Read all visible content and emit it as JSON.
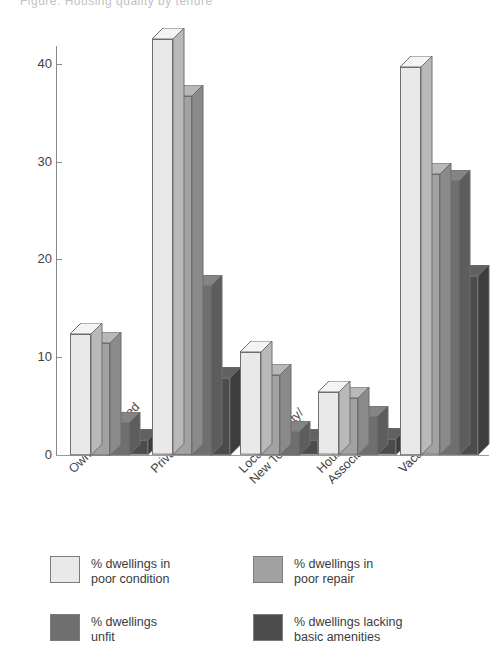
{
  "page": {
    "clipped_heading": "Figure: Housing quality by tenure"
  },
  "chart_data": {
    "type": "bar",
    "title": "",
    "xlabel": "",
    "ylabel": "",
    "ylim": [
      0,
      44
    ],
    "yticks": [
      0,
      10,
      20,
      30,
      40
    ],
    "ytick_labels": [
      "0",
      "10",
      "20",
      "30",
      "40"
    ],
    "grid": false,
    "legend_position": "bottom-left",
    "style": "3d-grouped-columns",
    "categories": [
      "Owner-Occupied",
      "Private-Rented",
      "Local Authority/\nNew Town",
      "Housing\nAssociation",
      "Vacant"
    ],
    "series": [
      {
        "name": "% dwellings in\npoor condition",
        "color": "#e9e9e9",
        "top_color": "#f4f4f4",
        "side_color": "#b9b9b9",
        "values": [
          12.4,
          42.5,
          10.5,
          6.4,
          39.7
        ]
      },
      {
        "name": "% dwellings in\npoor repair",
        "color": "#a2a2a2",
        "top_color": "#b8b8b8",
        "side_color": "#8a8a8a",
        "values": [
          11.5,
          36.7,
          8.2,
          5.8,
          28.7
        ]
      },
      {
        "name": "% dwellings\nunfit",
        "color": "#6f6f6f",
        "top_color": "#848484",
        "side_color": "#5d5d5d",
        "values": [
          3.3,
          17.3,
          2.4,
          3.9,
          28.0
        ]
      },
      {
        "name": "% dwellings lacking\nbasic amenities",
        "color": "#4c4c4c",
        "top_color": "#616161",
        "side_color": "#3d3d3d",
        "values": [
          1.5,
          7.9,
          1.5,
          1.6,
          18.3
        ]
      }
    ]
  },
  "legend": {
    "items": [
      {
        "label": "% dwellings in\npoor condition",
        "color": "#e9e9e9"
      },
      {
        "label": "% dwellings in\npoor repair",
        "color": "#a2a2a2"
      },
      {
        "label": "% dwellings\nunfit",
        "color": "#6f6f6f"
      },
      {
        "label": "% dwellings lacking\nbasic amenities",
        "color": "#4c4c4c"
      }
    ]
  }
}
